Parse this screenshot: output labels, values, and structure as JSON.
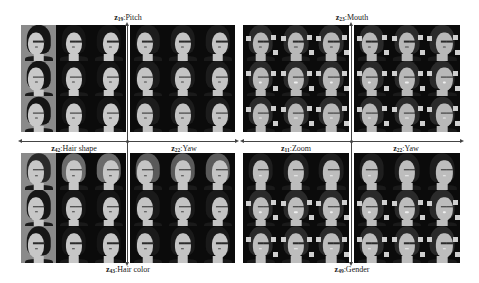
{
  "figure": {
    "left_block": {
      "top_label": {
        "var": "z",
        "sub": "19",
        "name": ":Pitch"
      },
      "bottom_label": {
        "var": "z",
        "sub": "43",
        "name": ":Hair color"
      },
      "mid_left_label": {
        "var": "z",
        "sub": "42",
        "name": ":Hair shape"
      },
      "mid_right_label": {
        "var": "z",
        "sub": "22",
        "name": ":Yaw"
      },
      "subject": "female face, long dark hair",
      "grid": "4 quadrants x 3x3 generated faces"
    },
    "right_block": {
      "top_label": {
        "var": "z",
        "sub": "23",
        "name": ":Mouth"
      },
      "bottom_label": {
        "var": "z",
        "sub": "49",
        "name": ":Gender"
      },
      "mid_left_label": {
        "var": "z",
        "sub": "11",
        "name": ":Zoom"
      },
      "mid_right_label": {
        "var": "z",
        "sub": "22",
        "name": ":Yaw"
      },
      "subject": "male/female smiling face, dark background",
      "grid": "4 quadrants x 3x3 generated faces"
    },
    "colors": {
      "background": "#ffffff",
      "cell_dark": "#0b0b0b",
      "cell_gray": "#8a8a8a",
      "arrow": "#444444",
      "text": "#222222"
    }
  }
}
